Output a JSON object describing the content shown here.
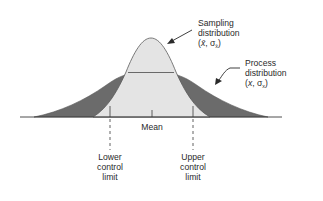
{
  "diagram": {
    "colors": {
      "process_fill": "#6b6b6b",
      "sampling_fill": "#e4e4e4",
      "outline": "#5a5a5a",
      "axis": "#3a3a3a",
      "text": "#2a2a2a"
    },
    "sampling_label": {
      "line1": "Sampling",
      "line2": "distribution",
      "params_open": "(",
      "mean_symbol": "x̄",
      "sep": ", σ",
      "sub": "x̄",
      "params_close": ")"
    },
    "process_label": {
      "line1": "Process",
      "line2": "distribution",
      "params_open": "(",
      "mean_symbol": "x",
      "sep": ", σ",
      "sub": "x",
      "params_close": ")"
    },
    "axis_labels": {
      "mean": "Mean",
      "lower": [
        "Lower",
        "control",
        "limit"
      ],
      "upper": [
        "Upper",
        "control",
        "limit"
      ]
    }
  }
}
